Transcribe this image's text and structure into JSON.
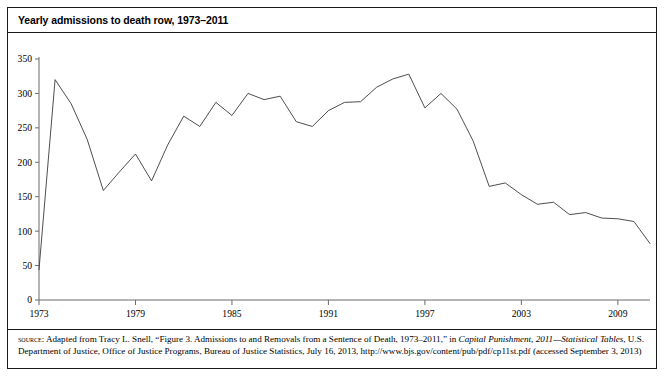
{
  "figure": {
    "title": "Yearly admissions to death row, 1973–2011",
    "source_label": "source:",
    "source_part1": " Adapted from Tracy L. Snell, “Figure 3. Admissions to and Removals from a Sentence of Death, 1973–2011,” in ",
    "source_italic1": "Capital Punishment, 2011—Statistical Tables",
    "source_part2": ", U.S. Department of Justice, Office of Justice Programs, Bureau of Justice Statistics, July 16, 2013, http://www.bjs.gov/content/pub/pdf/cp11st.pdf (accessed September 3, 2013)"
  },
  "colors": {
    "line": "#3a3a3a",
    "axis": "#6b6b6b",
    "frame": "#1a1a1a",
    "background": "#ffffff",
    "text": "#000000"
  },
  "chart_data": {
    "type": "line",
    "title": "Yearly admissions to death row, 1973–2011",
    "xlabel": "",
    "ylabel": "",
    "xlim": [
      1973,
      2011
    ],
    "ylim": [
      0,
      350
    ],
    "grid": false,
    "legend": "none",
    "ytick_labels": [
      "0",
      "50",
      "100",
      "150",
      "200",
      "250",
      "300",
      "350"
    ],
    "ytick_values": [
      0,
      50,
      100,
      150,
      200,
      250,
      300,
      350
    ],
    "xtick_labels": [
      "1973",
      "1979",
      "1985",
      "1991",
      "1997",
      "2003",
      "2009"
    ],
    "xtick_values": [
      1973,
      1979,
      1985,
      1991,
      1997,
      2003,
      2009
    ],
    "x": [
      1973,
      1974,
      1975,
      1976,
      1977,
      1978,
      1979,
      1980,
      1981,
      1982,
      1983,
      1984,
      1985,
      1986,
      1987,
      1988,
      1989,
      1990,
      1991,
      1992,
      1993,
      1994,
      1995,
      1996,
      1997,
      1998,
      1999,
      2000,
      2001,
      2002,
      2003,
      2004,
      2005,
      2006,
      2007,
      2008,
      2009,
      2010,
      2011
    ],
    "series": [
      {
        "name": "Admissions to death row",
        "values": [
          44,
          320,
          285,
          233,
          159,
          186,
          212,
          173,
          225,
          267,
          252,
          287,
          268,
          300,
          291,
          296,
          259,
          252,
          275,
          287,
          288,
          309,
          321,
          328,
          279,
          300,
          277,
          231,
          165,
          170,
          153,
          139,
          142,
          124,
          127,
          119,
          118,
          114,
          82
        ]
      }
    ]
  }
}
